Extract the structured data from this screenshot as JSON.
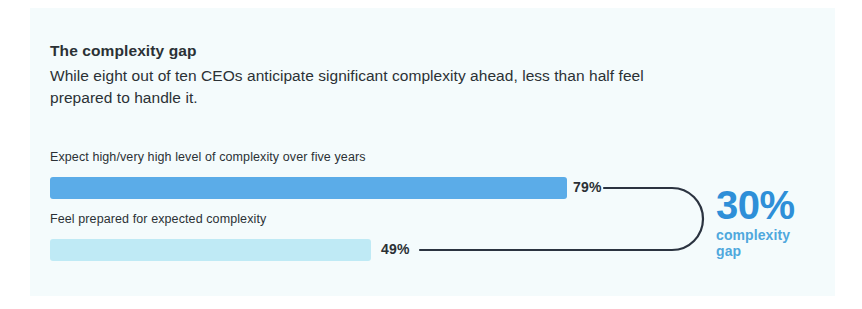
{
  "headline": {
    "title": "The complexity gap",
    "subtitle": "While eight out of ten CEOs anticipate significant complexity ahead, less than half feel prepared to handle it."
  },
  "callout": {
    "figure": "30%",
    "caption_line1": "complexity",
    "caption_line2": "gap",
    "figure_color": "#2e8fd8",
    "caption_color": "#4fa8dd"
  },
  "colors": {
    "panel_background": "#f4fbfc",
    "bar_primary": "#5bace8",
    "bar_secondary": "#bfeaf5",
    "text": "#2b3135",
    "connector_stroke": "#2b3340"
  },
  "chart_data": {
    "type": "bar",
    "title": "The complexity gap",
    "orientation": "horizontal",
    "xlabel": "",
    "ylabel": "",
    "xlim": [
      0,
      100
    ],
    "grid": false,
    "legend": "none",
    "value_suffix": "%",
    "categories": [
      "Expect high/very high level of complexity over five years",
      "Feel prepared for expected complexity"
    ],
    "values": [
      79,
      49
    ],
    "value_labels": [
      "79%",
      "49%"
    ],
    "bar_colors": [
      "#5bace8",
      "#bfeaf5"
    ],
    "annotations": [
      {
        "text": "30%",
        "caption": "complexity gap",
        "meaning": "difference between 79% and 49%",
        "value": 30
      }
    ]
  }
}
